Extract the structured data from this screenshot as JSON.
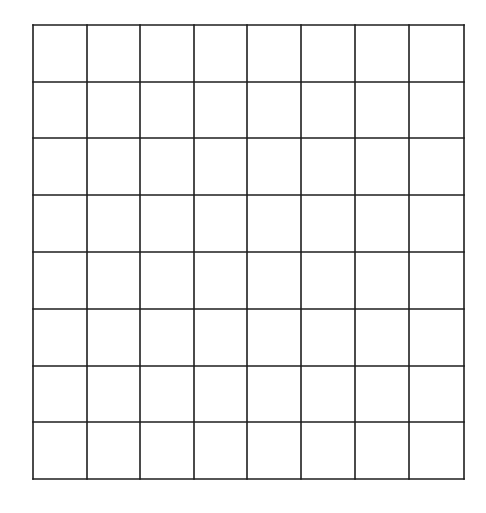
{
  "grid": {
    "rows": 8,
    "cols": 8,
    "left": 33,
    "top": 25,
    "right": 464,
    "bottom": 479,
    "x_lines": [
      33,
      87,
      140,
      194,
      247,
      301,
      355,
      409,
      464
    ],
    "y_lines": [
      25,
      82,
      138,
      195,
      252,
      309,
      366,
      422,
      479
    ],
    "line_color": "#1e1e1e",
    "line_width": 1.6,
    "background": "#ffffff"
  }
}
